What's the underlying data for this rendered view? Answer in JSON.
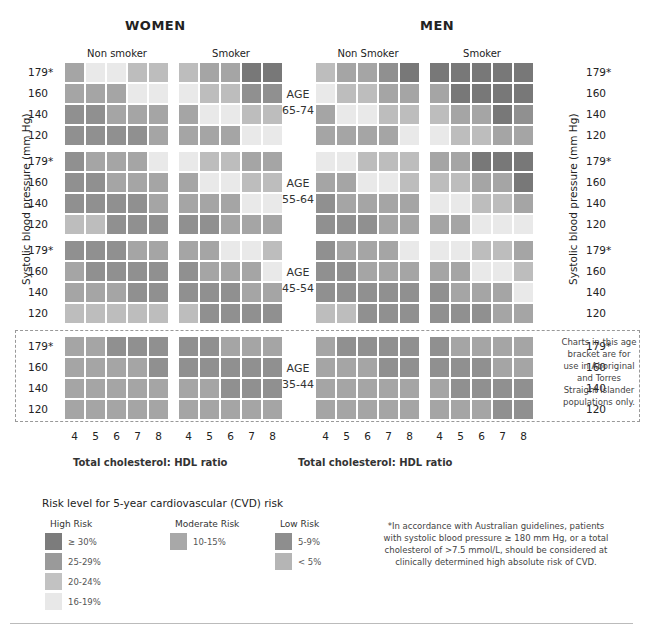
{
  "sections": {
    "women": "WOMEN",
    "men": "MEN"
  },
  "column_headers": {
    "women_nonsmoker": "Non smoker",
    "women_smoker": "Smoker",
    "men_nonsmoker": "Non Smoker",
    "men_smoker": "Smoker"
  },
  "y_axis_label": "Systolic blood pressure (mm Hg)",
  "bp_labels": [
    "179*",
    "160",
    "140",
    "120"
  ],
  "x_ticks": [
    "4",
    "5",
    "6",
    "7",
    "8"
  ],
  "x_axis_label": "Total cholesterol: HDL ratio",
  "age_groups": [
    {
      "line1": "AGE",
      "line2": "65-74"
    },
    {
      "line1": "AGE",
      "line2": "55-64"
    },
    {
      "line1": "AGE",
      "line2": "45-54"
    },
    {
      "line1": "AGE",
      "line2": "35-44"
    }
  ],
  "note_35_44": "Charts in this age bracket are for use in Aboriginal and Torres Straight Islander populations only.",
  "legend": {
    "title": "Risk level for 5-year cardiovascular (CVD) risk",
    "groups": [
      {
        "name": "High Risk",
        "items": [
          {
            "label": "≥ 30%",
            "color": "#7c7c7c"
          },
          {
            "label": "25-29%",
            "color": "#9a9a9a"
          },
          {
            "label": "20-24%",
            "color": "#c2c2c2"
          },
          {
            "label": "16-19%",
            "color": "#e8e8e8"
          }
        ]
      },
      {
        "name": "Moderate Risk",
        "items": [
          {
            "label": "10-15%",
            "color": "#a8a8a8"
          }
        ]
      },
      {
        "name": "Low Risk",
        "items": [
          {
            "label": "5-9%",
            "color": "#8e8e8e"
          },
          {
            "label": "< 5%",
            "color": "#b5b5b5"
          }
        ]
      }
    ]
  },
  "footnote": "*In accordance with Australian guidelines, patients with systolic blood pressure ≥ 180 mm Hg, or a total cholesterol of >7.5 mmol/L, should be considered at clinically determined high absolute risk of CVD.",
  "palette": [
    "#e9e9e9",
    "#d3d3d3",
    "#bdbdbd",
    "#a5a5a5",
    "#909090",
    "#787878"
  ],
  "chart_data": {
    "type": "heatmap",
    "title": "Risk level for 5-year cardiovascular (CVD) risk",
    "xlabel": "Total cholesterol: HDL ratio",
    "ylabel": "Systolic blood pressure (mm Hg)",
    "x": [
      4,
      5,
      6,
      7,
      8
    ],
    "y": [
      "179*",
      "160",
      "140",
      "120"
    ],
    "value_scale": "shade level 0 (lightest) to 5 (darkest)",
    "panels": {
      "women_nonsmoker": [
        [
          [
            3,
            0,
            0,
            2,
            2
          ],
          [
            3,
            3,
            3,
            0,
            0
          ],
          [
            4,
            4,
            3,
            3,
            3
          ],
          [
            4,
            4,
            4,
            4,
            3
          ]
        ],
        [
          [
            4,
            3,
            3,
            3,
            0
          ],
          [
            4,
            4,
            3,
            3,
            3
          ],
          [
            4,
            4,
            4,
            4,
            3
          ],
          [
            2,
            2,
            4,
            4,
            4
          ]
        ],
        [
          [
            4,
            4,
            4,
            3,
            3
          ],
          [
            3,
            4,
            4,
            4,
            4
          ],
          [
            3,
            3,
            3,
            4,
            4
          ],
          [
            2,
            2,
            2,
            2,
            2
          ]
        ],
        [
          [
            3,
            3,
            4,
            4,
            4
          ],
          [
            3,
            3,
            3,
            3,
            4
          ],
          [
            3,
            3,
            3,
            3,
            3
          ],
          [
            3,
            3,
            3,
            3,
            3
          ]
        ]
      ],
      "women_smoker": [
        [
          [
            2,
            3,
            3,
            5,
            5
          ],
          [
            0,
            2,
            2,
            4,
            4
          ],
          [
            3,
            0,
            0,
            2,
            2
          ],
          [
            3,
            3,
            3,
            0,
            0
          ]
        ],
        [
          [
            0,
            2,
            2,
            3,
            3
          ],
          [
            3,
            0,
            0,
            2,
            2
          ],
          [
            3,
            3,
            3,
            0,
            0
          ],
          [
            4,
            4,
            3,
            3,
            3
          ]
        ],
        [
          [
            3,
            3,
            0,
            0,
            2
          ],
          [
            4,
            3,
            3,
            3,
            0
          ],
          [
            4,
            4,
            4,
            3,
            3
          ],
          [
            2,
            4,
            4,
            4,
            4
          ]
        ],
        [
          [
            4,
            4,
            3,
            3,
            3
          ],
          [
            4,
            4,
            4,
            4,
            4
          ],
          [
            3,
            3,
            4,
            4,
            4
          ],
          [
            3,
            3,
            3,
            3,
            3
          ]
        ]
      ],
      "men_nonsmoker": [
        [
          [
            2,
            3,
            3,
            4,
            5
          ],
          [
            0,
            2,
            2,
            3,
            3
          ],
          [
            3,
            0,
            0,
            2,
            2
          ],
          [
            3,
            3,
            3,
            3,
            0
          ]
        ],
        [
          [
            0,
            0,
            2,
            2,
            2
          ],
          [
            3,
            3,
            0,
            0,
            2
          ],
          [
            4,
            3,
            3,
            3,
            3
          ],
          [
            4,
            4,
            4,
            3,
            3
          ]
        ],
        [
          [
            4,
            3,
            3,
            3,
            0
          ],
          [
            4,
            4,
            3,
            3,
            3
          ],
          [
            4,
            4,
            4,
            4,
            4
          ],
          [
            2,
            2,
            4,
            4,
            4
          ]
        ],
        [
          [
            3,
            4,
            4,
            4,
            4
          ],
          [
            3,
            3,
            3,
            4,
            4
          ],
          [
            3,
            3,
            3,
            3,
            3
          ],
          [
            3,
            3,
            3,
            3,
            3
          ]
        ]
      ],
      "men_smoker": [
        [
          [
            5,
            5,
            5,
            5,
            5
          ],
          [
            3,
            5,
            5,
            5,
            5
          ],
          [
            2,
            3,
            3,
            5,
            4
          ],
          [
            0,
            2,
            2,
            3,
            3
          ]
        ],
        [
          [
            3,
            3,
            5,
            5,
            5
          ],
          [
            2,
            2,
            3,
            3,
            5
          ],
          [
            0,
            0,
            2,
            2,
            3
          ],
          [
            3,
            3,
            0,
            0,
            0
          ]
        ],
        [
          [
            0,
            0,
            2,
            2,
            3
          ],
          [
            3,
            3,
            0,
            0,
            2
          ],
          [
            4,
            3,
            3,
            3,
            0
          ],
          [
            4,
            4,
            4,
            3,
            3
          ]
        ],
        [
          [
            4,
            3,
            3,
            3,
            3
          ],
          [
            4,
            4,
            4,
            3,
            3
          ],
          [
            3,
            4,
            4,
            4,
            4
          ],
          [
            3,
            3,
            3,
            4,
            4
          ]
        ]
      ]
    },
    "age_bands": [
      "65-74",
      "55-64",
      "45-54",
      "35-44"
    ],
    "legend": [
      "≥ 30%",
      "25-29%",
      "20-24%",
      "16-19%",
      "10-15%",
      "5-9%",
      "< 5%"
    ]
  }
}
